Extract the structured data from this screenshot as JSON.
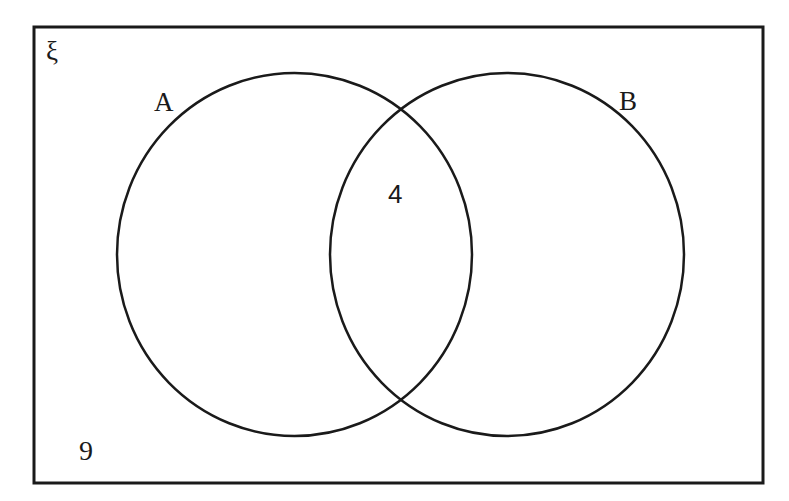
{
  "diagram": {
    "type": "venn",
    "universal_set": {
      "symbol": "ξ",
      "outside_count": "9"
    },
    "sets": [
      {
        "label": "A",
        "only_count": ""
      },
      {
        "label": "B",
        "only_count": ""
      }
    ],
    "intersection": {
      "sets": [
        "A",
        "B"
      ],
      "count": "4"
    },
    "colors": {
      "stroke": "#1a1a1a",
      "background": "#ffffff"
    }
  }
}
